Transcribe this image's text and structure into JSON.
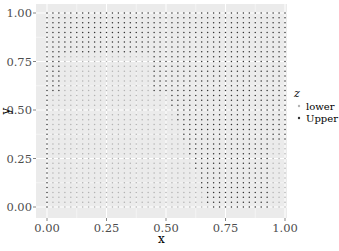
{
  "chart_data": {
    "type": "scatter",
    "title": "",
    "xlabel": "x",
    "ylabel": "y",
    "xlim": [
      -0.03,
      1.03
    ],
    "ylim": [
      -0.05,
      1.05
    ],
    "x_ticks": [
      0.0,
      0.25,
      0.5,
      0.75,
      1.0
    ],
    "x_tick_labels": [
      "0.00",
      "0.25",
      "0.50",
      "0.75",
      "1.00"
    ],
    "y_ticks": [
      0.0,
      0.25,
      0.5,
      0.75,
      1.0
    ],
    "y_tick_labels": [
      "0.00",
      "0.25",
      "0.50",
      "0.75",
      "1.00"
    ],
    "grid": true,
    "panel_background": "#ebebeb",
    "grid_color": "#ffffff",
    "point_grid": {
      "x_start": 0.0,
      "x_end": 1.0,
      "y_start": 0.0,
      "y_end": 1.0,
      "step": 0.025
    },
    "color_by": "z",
    "series": [
      {
        "name": "lower",
        "color": "#b3b3b3",
        "region_description": "wedge from bottom-left: y < ~0.6 and x < ~0.5-0.65 (boundary slants right toward bottom), plus light patch 0.05<x<0.45, 0.6<y<0.8"
      },
      {
        "name": "Upper",
        "color": "#333333",
        "region_description": "top band (y > ~0.8), left strip near x=0 for y>0.5, and right side (x > ~0.55-0.7)"
      }
    ],
    "legend": {
      "title": "z",
      "position": "right",
      "entries": [
        "lower",
        "Upper"
      ]
    }
  }
}
